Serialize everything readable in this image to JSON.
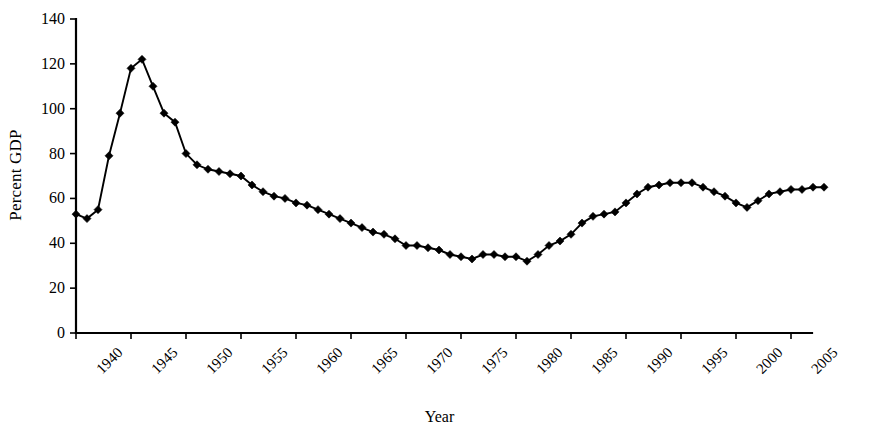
{
  "chart_data": {
    "type": "line",
    "title": "",
    "subtitle": "",
    "xlabel": "Year",
    "ylabel": "Percent GDP",
    "xlim": [
      1940,
      1941
    ],
    "ylim": [
      0,
      140
    ],
    "grid": false,
    "legend": null,
    "y_ticks": [
      0,
      20,
      40,
      60,
      80,
      100,
      120,
      140
    ],
    "y_tick_labels": [
      "0",
      "20",
      "40",
      "60",
      "80",
      "100",
      "120",
      "140"
    ],
    "x_ticks": [
      1940,
      1945,
      1950,
      1955,
      1960,
      1965,
      1970,
      1975,
      1980,
      1985,
      1990,
      1995,
      2000,
      2005
    ],
    "x_tick_labels": [
      "1940",
      "1945",
      "1950",
      "1955",
      "1960",
      "1965",
      "1970",
      "1975",
      "1980",
      "1985",
      "1990",
      "1995",
      "2000",
      "2005"
    ],
    "marker": "diamond",
    "series": [
      {
        "name": "Percent GDP",
        "color": "#000000",
        "x": [
          1940,
          1941,
          1942,
          1943,
          1944,
          1945,
          1946,
          1947,
          1948,
          1949,
          1950,
          1951,
          1952,
          1953,
          1954,
          1955,
          1956,
          1957,
          1958,
          1959,
          1960,
          1961,
          1962,
          1963,
          1964,
          1965,
          1966,
          1967,
          1968,
          1969,
          1970,
          1971,
          1972,
          1973,
          1974,
          1975,
          1976,
          1977,
          1978,
          1979,
          1980,
          1981,
          1982,
          1983,
          1984,
          1985,
          1986,
          1987,
          1988,
          1989,
          1990,
          1991,
          1992,
          1993,
          1994,
          1995,
          1996,
          1997,
          1998,
          1999,
          2000,
          2001,
          2002,
          2003,
          2004,
          2005,
          2006,
          2007,
          2008
        ],
        "y": [
          53,
          51,
          55,
          79,
          98,
          118,
          122,
          110,
          98,
          94,
          80,
          75,
          73,
          72,
          71,
          70,
          66,
          63,
          61,
          60,
          58,
          57,
          55,
          53,
          51,
          49,
          47,
          45,
          44,
          42,
          39,
          39,
          38,
          37,
          35,
          34,
          33,
          35,
          35,
          34,
          34,
          32,
          35,
          39,
          41,
          44,
          49,
          52,
          53,
          54,
          58,
          62,
          65,
          66,
          67,
          67,
          67,
          65,
          63,
          61,
          58,
          56,
          59,
          62,
          63,
          64,
          64,
          65,
          65
        ]
      }
    ]
  },
  "axes": {
    "y_title": "Percent GDP",
    "x_title": "Year"
  }
}
